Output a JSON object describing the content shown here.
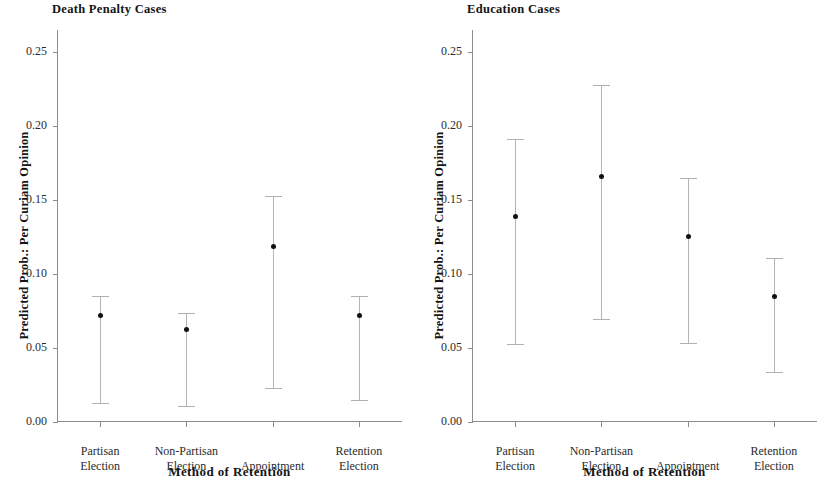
{
  "figure": {
    "xlabel": "Method of Retention",
    "ylabel": "Predicted Prob.: Per Curiam Opinion"
  },
  "chart_data": [
    {
      "type": "scatter",
      "title": "Death Penalty Cases",
      "xlabel": "Method of Retention",
      "ylabel": "Predicted Prob.: Per Curiam Opinion",
      "ylim": [
        0.0,
        0.265
      ],
      "yticks": [
        "0.00",
        "0.05",
        "0.10",
        "0.15",
        "0.20",
        "0.25"
      ],
      "ytick_values": [
        0.0,
        0.05,
        0.1,
        0.15,
        0.2,
        0.25
      ],
      "grid": false,
      "legend": "none",
      "categories": [
        "Partisan Election",
        "Non-Partisan Election",
        "Appointment",
        "Retention Election"
      ],
      "category_lines": [
        [
          "Partisan",
          "Election"
        ],
        [
          "Non-Partisan",
          "Election"
        ],
        [
          "Appointment",
          ""
        ],
        [
          "Retention",
          "Election"
        ]
      ],
      "values": [
        0.072,
        0.063,
        0.119,
        0.072
      ],
      "ci_lower": [
        0.012,
        0.01,
        0.022,
        0.014
      ],
      "ci_upper": [
        0.085,
        0.074,
        0.153,
        0.085
      ]
    },
    {
      "type": "scatter",
      "title": "Education Cases",
      "xlabel": "Method of Retention",
      "ylabel": "Predicted Prob.: Per Curiam Opinion",
      "ylim": [
        0.0,
        0.265
      ],
      "yticks": [
        "0.00",
        "0.05",
        "0.10",
        "0.15",
        "0.20",
        "0.25"
      ],
      "ytick_values": [
        0.0,
        0.05,
        0.1,
        0.15,
        0.2,
        0.25
      ],
      "grid": false,
      "legend": "none",
      "categories": [
        "Partisan Election",
        "Non-Partisan Election",
        "Appointment",
        "Retention Election"
      ],
      "category_lines": [
        [
          "Partisan",
          "Election"
        ],
        [
          "Non-Partisan",
          "Election"
        ],
        [
          "Appointment",
          ""
        ],
        [
          "Retention",
          "Election"
        ]
      ],
      "values": [
        0.139,
        0.166,
        0.126,
        0.085
      ],
      "ci_lower": [
        0.052,
        0.069,
        0.053,
        0.033
      ],
      "ci_upper": [
        0.191,
        0.228,
        0.165,
        0.111
      ]
    }
  ],
  "colors": {
    "point": "#111111",
    "errorbar": "#b4b4b4",
    "axis": "#8c8c8c",
    "text": "#141414",
    "background": "#ffffff"
  }
}
